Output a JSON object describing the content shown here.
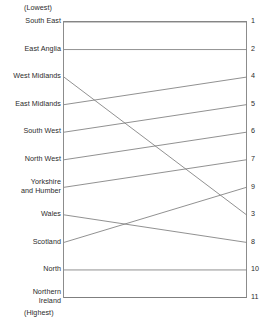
{
  "captions": {
    "top": "(Lowest)",
    "bottom": "(Highest)"
  },
  "chart_data": {
    "type": "line",
    "title": "",
    "subtitle": "",
    "xlabel": "",
    "ylabel": "",
    "grid": false,
    "legend": "none",
    "axis_top_note": "(Lowest)",
    "axis_bottom_note": "(Highest)",
    "ylim": [
      1,
      11
    ],
    "y_direction": "inverted",
    "left_axis_labels": [
      "South East",
      "East Anglia",
      "West Midlands",
      "East Midlands",
      "South West",
      "North West",
      "Yorkshire and Humber",
      "Wales",
      "Scotland",
      "North",
      "Northern Ireland"
    ],
    "right_axis_labels": [
      "1",
      "2",
      "3",
      "4",
      "5",
      "6",
      "7",
      "8",
      "9",
      "10",
      "11"
    ],
    "categories": [
      "South East",
      "East Anglia",
      "West Midlands",
      "East Midlands",
      "South West",
      "North West",
      "Yorkshire and Humber",
      "Wales",
      "Scotland",
      "North",
      "Northern Ireland"
    ],
    "series": [
      {
        "name": "Left rank",
        "values": [
          1,
          2,
          3,
          4,
          5,
          6,
          7,
          8,
          9,
          10,
          11
        ]
      },
      {
        "name": "Right rank",
        "values": [
          1,
          2,
          8,
          3,
          4,
          5,
          6,
          9,
          7,
          10,
          11
        ]
      }
    ],
    "connections": [
      {
        "label": "South East",
        "left": 1,
        "right": 1
      },
      {
        "label": "East Anglia",
        "left": 2,
        "right": 2
      },
      {
        "label": "West Midlands",
        "left": 3,
        "right": 8
      },
      {
        "label": "East Midlands",
        "left": 4,
        "right": 3
      },
      {
        "label": "South West",
        "left": 5,
        "right": 4
      },
      {
        "label": "North West",
        "left": 6,
        "right": 5
      },
      {
        "label": "Yorkshire and Humber",
        "left": 7,
        "right": 6
      },
      {
        "label": "Wales",
        "left": 8,
        "right": 9
      },
      {
        "label": "Scotland",
        "left": 9,
        "right": 7
      },
      {
        "label": "North",
        "left": 10,
        "right": 10
      },
      {
        "label": "Northern Ireland",
        "left": 11,
        "right": 11
      }
    ]
  },
  "rows": [
    {
      "label": "South East",
      "label_lines": [
        "South East"
      ],
      "rank": "1",
      "left": 1,
      "right": 1
    },
    {
      "label": "East Anglia",
      "label_lines": [
        "East Anglia"
      ],
      "rank": "2",
      "left": 2,
      "right": 2
    },
    {
      "label": "West Midlands",
      "label_lines": [
        "West Midlands"
      ],
      "rank": "3",
      "left": 3,
      "right": 8
    },
    {
      "label": "East Midlands",
      "label_lines": [
        "East Midlands"
      ],
      "rank": "4",
      "left": 4,
      "right": 3
    },
    {
      "label": "South West",
      "label_lines": [
        "South West"
      ],
      "rank": "5",
      "left": 5,
      "right": 4
    },
    {
      "label": "North West",
      "label_lines": [
        "North West"
      ],
      "rank": "6",
      "left": 6,
      "right": 5
    },
    {
      "label": "Yorkshire and Humber",
      "label_lines": [
        "Yorkshire",
        "and Humber"
      ],
      "rank": "7",
      "left": 7,
      "right": 6
    },
    {
      "label": "Wales",
      "label_lines": [
        "Wales"
      ],
      "rank": "8",
      "left": 8,
      "right": 9
    },
    {
      "label": "Scotland",
      "label_lines": [
        "Scotland"
      ],
      "rank": "9",
      "left": 9,
      "right": 7
    },
    {
      "label": "North",
      "label_lines": [
        "North"
      ],
      "rank": "10",
      "left": 10,
      "right": 10
    },
    {
      "label": "Northern Ireland",
      "label_lines": [
        "Northern",
        "Ireland"
      ],
      "rank": "11",
      "left": 11,
      "right": 11
    }
  ],
  "colors": {
    "line": "#7d7d7d",
    "frame": "#8c8c8c",
    "text": "#2b2b2b",
    "background": "#ffffff"
  }
}
